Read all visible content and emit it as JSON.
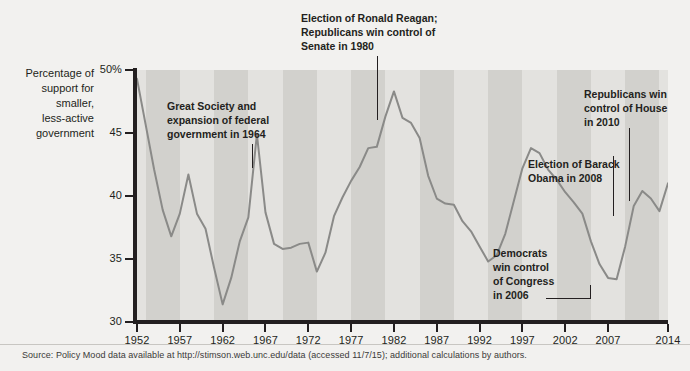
{
  "chart_data": {
    "type": "line",
    "title": "",
    "xlabel": "",
    "ylabel": "Percentage of support for smaller, less-active government",
    "xlim": [
      1952,
      2014
    ],
    "ylim": [
      30,
      50
    ],
    "grid": false,
    "legend": "none",
    "y_ticks": [
      {
        "value": 50,
        "label": "50%"
      },
      {
        "value": 45,
        "label": "45"
      },
      {
        "value": 40,
        "label": "40"
      },
      {
        "value": 35,
        "label": "35"
      },
      {
        "value": 30,
        "label": "30"
      }
    ],
    "x_ticks": [
      {
        "value": 1952,
        "label": "1952"
      },
      {
        "value": 1957,
        "label": "1957"
      },
      {
        "value": 1962,
        "label": "1962"
      },
      {
        "value": 1967,
        "label": "1967"
      },
      {
        "value": 1972,
        "label": "1972"
      },
      {
        "value": 1977,
        "label": "1977"
      },
      {
        "value": 1982,
        "label": "1982"
      },
      {
        "value": 1987,
        "label": "1987"
      },
      {
        "value": 1992,
        "label": "1992"
      },
      {
        "value": 1997,
        "label": "1997"
      },
      {
        "value": 2002,
        "label": "2002"
      },
      {
        "value": 2007,
        "label": "2007"
      },
      {
        "value": 2014,
        "label": "2014"
      }
    ],
    "series": [
      {
        "name": "Policy Mood (support for smaller, less-active government)",
        "color": "#8a8a88",
        "x": [
          1952,
          1953,
          1954,
          1955,
          1956,
          1957,
          1958,
          1959,
          1960,
          1961,
          1962,
          1963,
          1964,
          1965,
          1966,
          1967,
          1968,
          1969,
          1970,
          1971,
          1972,
          1973,
          1974,
          1975,
          1976,
          1977,
          1978,
          1979,
          1980,
          1981,
          1982,
          1983,
          1984,
          1985,
          1986,
          1987,
          1988,
          1989,
          1990,
          1991,
          1992,
          1993,
          1994,
          1995,
          1996,
          1997,
          1998,
          1999,
          2000,
          2001,
          2002,
          2003,
          2004,
          2005,
          2006,
          2007,
          2008,
          2009,
          2010,
          2011,
          2012,
          2013,
          2014
        ],
        "y": [
          49.3,
          45.7,
          42.1,
          38.9,
          36.8,
          38.6,
          41.7,
          38.6,
          37.4,
          34.3,
          31.4,
          33.5,
          36.4,
          38.3,
          44.9,
          38.7,
          36.2,
          35.8,
          35.9,
          36.2,
          36.3,
          34.0,
          35.5,
          38.4,
          39.9,
          41.2,
          42.3,
          43.8,
          43.9,
          46.3,
          48.3,
          46.2,
          45.8,
          44.6,
          41.6,
          39.8,
          39.4,
          39.3,
          38.0,
          37.2,
          36.0,
          34.8,
          35.3,
          37.0,
          39.6,
          42.2,
          43.8,
          43.4,
          42.1,
          41.3,
          40.3,
          39.5,
          38.6,
          36.4,
          34.6,
          33.5,
          33.4,
          36.0,
          39.2,
          40.4,
          39.8,
          38.8,
          41.0
        ]
      }
    ],
    "annotations": [
      {
        "id": "great-society",
        "text": "Great Society and expansion of federal government in 1964",
        "lines": [
          "Great Society and",
          "expansion of federal",
          "government in 1964"
        ],
        "target_year": 1966
      },
      {
        "id": "reagan-election",
        "text": "Election of Ronald Reagan; Republicans win control of Senate in 1980",
        "lines": [
          "Election of Ronald Reagan;",
          "Republicans win control of",
          "Senate in 1980"
        ],
        "target_year": 1981
      },
      {
        "id": "democrats-congress",
        "text": "Democrats win control of Congress in 2006",
        "lines": [
          "Democrats",
          "win control",
          "of Congress",
          "in 2006"
        ],
        "target_year": 2006
      },
      {
        "id": "obama-election",
        "text": "Election of Barack Obama in 2008",
        "lines": [
          "Election of Barack",
          "Obama in 2008"
        ],
        "target_year": 2008
      },
      {
        "id": "republicans-house",
        "text": "Republicans win control of House in 2010",
        "lines": [
          "Republicans win",
          "control of House",
          "in 2010"
        ],
        "target_year": 2010
      }
    ],
    "bands": {
      "color_light": "#e3e2df",
      "color_dark": "#d2d1cd",
      "description": "alternating vertical shaded bands marking presidential terms"
    }
  },
  "y_axis_title": {
    "line1": "Percentage of",
    "line2": "support for",
    "line3": "smaller,",
    "line4": "less-active",
    "line5": "government"
  },
  "source": {
    "note": "Source: Policy Mood data available at http://stimson.web.unc.edu/data (accessed 11/7/15); additional calculations by authors."
  },
  "colors": {
    "line": "#8a8a88",
    "axis": "#231f20",
    "text": "#231f20",
    "plot_light": "#e3e2df",
    "plot_dark": "#d2d1cd",
    "page_background": "#f2f1ef"
  }
}
